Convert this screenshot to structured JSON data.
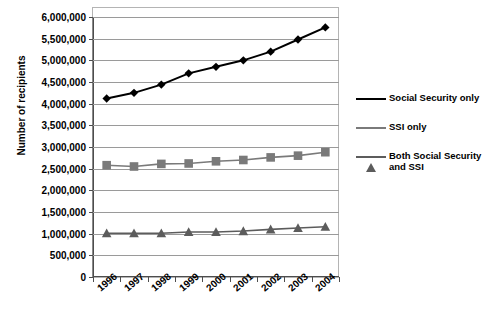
{
  "chart_data": {
    "type": "line",
    "title": "",
    "xlabel": "",
    "ylabel": "Number of recipients",
    "categories": [
      "1996",
      "1997",
      "1998",
      "1999",
      "2000",
      "2001",
      "2002",
      "2003",
      "2004"
    ],
    "ylim": [
      0,
      6000000
    ],
    "ytick_step": 500000,
    "ytick_labels": [
      "0",
      "500,000",
      "1,000,000",
      "1,500,000",
      "2,000,000",
      "2,500,000",
      "3,000,000",
      "3,500,000",
      "4,000,000",
      "4,500,000",
      "5,000,000",
      "5,500,000",
      "6,000,000"
    ],
    "grid": true,
    "legend_position": "right",
    "series": [
      {
        "name": "Social Security only",
        "color": "#000000",
        "marker": "diamond",
        "values": [
          4120000,
          4250000,
          4440000,
          4700000,
          4850000,
          5000000,
          5200000,
          5480000,
          5760000
        ]
      },
      {
        "name": "SSI only",
        "color": "#7a7a7a",
        "marker": "square",
        "values": [
          2580000,
          2550000,
          2610000,
          2620000,
          2670000,
          2700000,
          2760000,
          2800000,
          2880000
        ]
      },
      {
        "name": "Both Social Security and SSI",
        "color": "#5c5c5c",
        "marker": "triangle",
        "values": [
          1010000,
          1010000,
          1010000,
          1040000,
          1040000,
          1060000,
          1100000,
          1130000,
          1160000
        ]
      }
    ]
  },
  "legend": {
    "items": [
      {
        "label": "Social Security only"
      },
      {
        "label": "SSI only"
      },
      {
        "label": "Both Social Security and SSI"
      }
    ]
  }
}
